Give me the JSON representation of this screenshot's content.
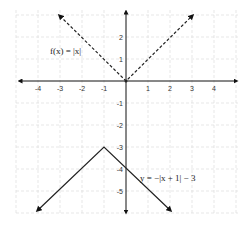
{
  "chart_data": {
    "type": "line",
    "title": "",
    "xlabel": "",
    "ylabel": "",
    "xlim": [
      -4.9,
      4.9
    ],
    "ylim": [
      -5.9,
      3.6
    ],
    "grid": true,
    "x_ticks": [
      "-4",
      "-3",
      "-2",
      "-1",
      "1",
      "2",
      "3",
      "4"
    ],
    "y_ticks": [
      "2",
      "1",
      "-1",
      "-2",
      "-3",
      "-4",
      "-5"
    ],
    "series": [
      {
        "name": "f(x) = |x|",
        "style": "dashed",
        "points": [
          [
            -3.4,
            3.4
          ],
          [
            0,
            0
          ],
          [
            3.4,
            3.4
          ]
        ]
      },
      {
        "name": "y = -|x + 1| - 3",
        "style": "solid",
        "points": [
          [
            -4.3,
            -6.3
          ],
          [
            -1,
            -3
          ],
          [
            2.0,
            -6.0
          ]
        ]
      }
    ],
    "annotations": [
      {
        "text": "f(x) = |x|",
        "x": -2.3,
        "y": 1.2
      },
      {
        "text": "y = −|x + 1| − 3",
        "x": 1.6,
        "y": -4.1
      }
    ]
  },
  "labels": {
    "f_label": "f(x) = |x|",
    "g_label": "y = −|x + 1| − 3"
  },
  "ticks": {
    "x": [
      {
        "v": -4,
        "t": "-4"
      },
      {
        "v": -3,
        "t": "-3"
      },
      {
        "v": -2,
        "t": "-2"
      },
      {
        "v": -1,
        "t": "-1"
      },
      {
        "v": 1,
        "t": "1"
      },
      {
        "v": 2,
        "t": "2"
      },
      {
        "v": 3,
        "t": "3"
      },
      {
        "v": 4,
        "t": "4"
      }
    ],
    "y": [
      {
        "v": 2,
        "t": "2"
      },
      {
        "v": 1,
        "t": "1"
      },
      {
        "v": -1,
        "t": "-1"
      },
      {
        "v": -2,
        "t": "-2"
      },
      {
        "v": -3,
        "t": "-3"
      },
      {
        "v": -4,
        "t": "-4"
      },
      {
        "v": -5,
        "t": "-5"
      }
    ]
  }
}
